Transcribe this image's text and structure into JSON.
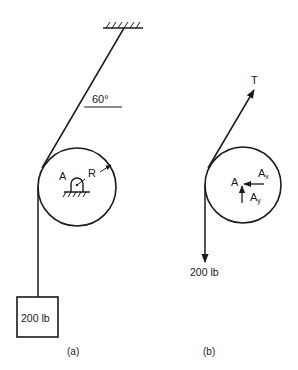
{
  "figure_a": {
    "caption": "(a)",
    "angle_label": "60°",
    "pin_label": "A",
    "radius_label": "R",
    "weight_label": "200 lb"
  },
  "figure_b": {
    "caption": "(b)",
    "tension_label": "T",
    "pin_label": "A",
    "reaction_x_label": "A",
    "reaction_x_sub": "x",
    "reaction_y_label": "A",
    "reaction_y_sub": "y",
    "weight_label": "200 lb"
  },
  "colors": {
    "ink": "#1a1a1a",
    "background": "#ffffff"
  }
}
